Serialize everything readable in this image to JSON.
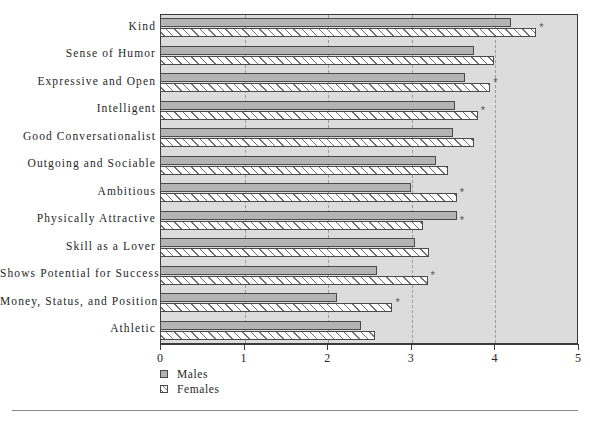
{
  "chart_data": {
    "type": "bar",
    "orientation": "horizontal",
    "title": "",
    "subtitle": "",
    "xlabel": "",
    "ylabel": "",
    "xlim": [
      0,
      5
    ],
    "xticks": [
      "0",
      "1",
      "2",
      "3",
      "4",
      "5"
    ],
    "grid": "vertical dashed gridlines at 1,2,3,4",
    "legend_position": "below-axis-left",
    "significance_marker": "*",
    "categories": [
      "Kind",
      "Sense of Humor",
      "Expressive and Open",
      "Intelligent",
      "Good Conversationalist",
      "Outgoing and Sociable",
      "Ambitious",
      "Physically Attractive",
      "Skill as a Lover",
      "Shows Potential for Success",
      "Money, Status, and Position",
      "Athletic"
    ],
    "series": [
      {
        "name": "Males",
        "values": [
          4.2,
          3.75,
          3.65,
          3.53,
          3.5,
          3.3,
          3.0,
          3.55,
          3.05,
          2.6,
          2.12,
          2.4
        ]
      },
      {
        "name": "Females",
        "values": [
          4.5,
          4.0,
          3.95,
          3.8,
          3.75,
          3.45,
          3.55,
          3.15,
          3.22,
          3.2,
          2.78,
          2.57
        ]
      }
    ],
    "significant": [
      true,
      false,
      true,
      true,
      false,
      false,
      true,
      true,
      false,
      true,
      true,
      false
    ],
    "colors": {
      "males_fill": "#b4b4b4",
      "females_fill": "#ffffff",
      "plot_background": "#dcdcdc",
      "bar_border": "#4a4a4a",
      "axis": "#3a3a3a",
      "gridline": "#9a9a9a"
    }
  },
  "legend": {
    "items": [
      {
        "label": "Males"
      },
      {
        "label": "Females"
      }
    ]
  }
}
